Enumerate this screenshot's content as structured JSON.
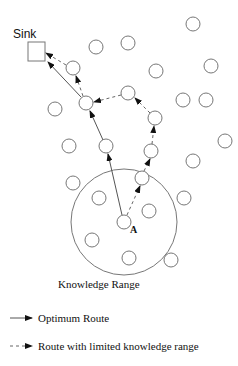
{
  "diagram": {
    "sink_label": "Sink",
    "node_a_label": "A",
    "range_label": "Knowledge Range",
    "legend": {
      "optimum": "Optimum Route",
      "limited": "Route with limited knowledge range"
    }
  },
  "sink": {
    "x": 28,
    "y": 42,
    "w": 17,
    "h": 19
  },
  "knowledge_range": {
    "cx": 124,
    "cy": 222,
    "r": 53
  },
  "node_radius": 7,
  "nodes": [
    {
      "x": 193,
      "y": 24
    },
    {
      "x": 96,
      "y": 47
    },
    {
      "x": 128,
      "y": 43
    },
    {
      "x": 73,
      "y": 68
    },
    {
      "x": 156,
      "y": 71
    },
    {
      "x": 211,
      "y": 66
    },
    {
      "x": 86,
      "y": 103
    },
    {
      "x": 128,
      "y": 93
    },
    {
      "x": 183,
      "y": 100
    },
    {
      "x": 206,
      "y": 100
    },
    {
      "x": 55,
      "y": 109
    },
    {
      "x": 155,
      "y": 118
    },
    {
      "x": 69,
      "y": 146
    },
    {
      "x": 106,
      "y": 146
    },
    {
      "x": 151,
      "y": 151
    },
    {
      "x": 225,
      "y": 141
    },
    {
      "x": 193,
      "y": 161
    },
    {
      "x": 73,
      "y": 183
    },
    {
      "x": 99,
      "y": 198
    },
    {
      "x": 142,
      "y": 178
    },
    {
      "x": 149,
      "y": 211
    },
    {
      "x": 124,
      "y": 222,
      "id": "A"
    },
    {
      "x": 92,
      "y": 240
    },
    {
      "x": 129,
      "y": 258
    },
    {
      "x": 171,
      "y": 260
    },
    {
      "x": 184,
      "y": 198
    }
  ],
  "routes": {
    "optimum": [
      [
        124,
        222
      ],
      [
        106,
        146
      ],
      [
        86,
        103
      ],
      [
        45,
        60
      ]
    ],
    "limited": [
      [
        124,
        222
      ],
      [
        142,
        178
      ],
      [
        151,
        151
      ],
      [
        155,
        118
      ],
      [
        128,
        93
      ],
      [
        86,
        103
      ],
      [
        73,
        68
      ],
      [
        45,
        52
      ]
    ]
  }
}
